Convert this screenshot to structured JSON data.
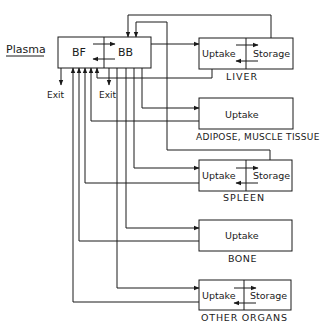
{
  "plasma": {
    "label": "Plasma",
    "left": "BF",
    "right": "BB",
    "exit_left": "Exit",
    "exit_right": "Exit"
  },
  "organs": [
    {
      "name": "LIVER",
      "left": "Uptake",
      "right": "Storage"
    },
    {
      "name": "ADIPOSE, MUSCLE TISSUE",
      "left": "Uptake"
    },
    {
      "name": "SPLEEN",
      "left": "Uptake",
      "right": "Storage"
    },
    {
      "name": "BONE",
      "left": "Uptake"
    },
    {
      "name": "OTHER ORGANS",
      "left": "Uptake",
      "right": "Storage"
    }
  ],
  "colors": {
    "line": "#1a1a1a",
    "background": "#ffffff"
  }
}
